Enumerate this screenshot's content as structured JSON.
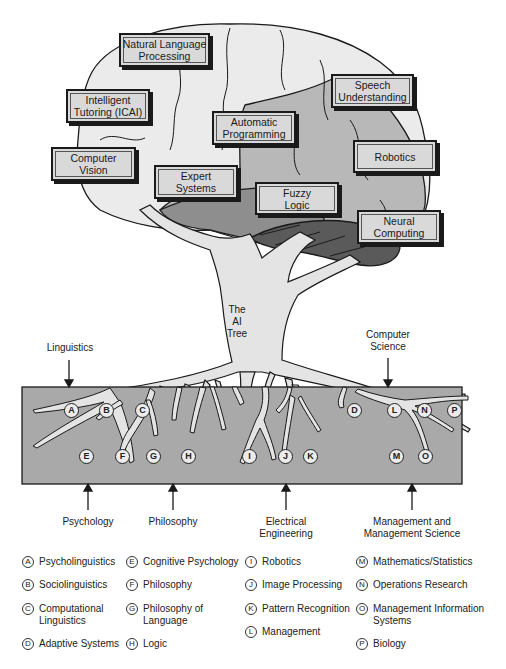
{
  "title": "The AI Tree",
  "trunk_label": "The\nAI\nTree",
  "brain_boxes": [
    {
      "id": "nlp",
      "label": "Natural Language\nProcessing"
    },
    {
      "id": "icai",
      "label": "Intelligent\nTutoring (ICAI)"
    },
    {
      "id": "vision",
      "label": "Computer\nVision"
    },
    {
      "id": "autoprog",
      "label": "Automatic\nProgramming"
    },
    {
      "id": "expert",
      "label": "Expert\nSystems"
    },
    {
      "id": "fuzzy",
      "label": "Fuzzy\nLogic"
    },
    {
      "id": "speech",
      "label": "Speech\nUnderstanding"
    },
    {
      "id": "robotics",
      "label": "Robotics"
    },
    {
      "id": "neural",
      "label": "Neural\nComputing"
    }
  ],
  "disciplines_top": [
    {
      "label": "Linguistics"
    },
    {
      "label": "Computer\nScience"
    }
  ],
  "disciplines_bottom": [
    {
      "label": "Psychology"
    },
    {
      "label": "Philosophy"
    },
    {
      "label": "Electrical\nEngineering"
    },
    {
      "label": "Management and\nManagement Science"
    }
  ],
  "root_letters": [
    "A",
    "B",
    "C",
    "D",
    "E",
    "F",
    "G",
    "H",
    "I",
    "J",
    "K",
    "L",
    "M",
    "N",
    "O",
    "P"
  ],
  "legend": [
    {
      "letter": "A",
      "label": "Psycholinguistics"
    },
    {
      "letter": "B",
      "label": "Sociolinguistics"
    },
    {
      "letter": "C",
      "label": "Computational\nLinguistics"
    },
    {
      "letter": "D",
      "label": "Adaptive Systems"
    },
    {
      "letter": "E",
      "label": "Cognitive Psychology"
    },
    {
      "letter": "F",
      "label": "Philosophy"
    },
    {
      "letter": "G",
      "label": "Philosophy of\nLanguage"
    },
    {
      "letter": "H",
      "label": "Logic"
    },
    {
      "letter": "I",
      "label": "Robotics"
    },
    {
      "letter": "J",
      "label": "Image Processing"
    },
    {
      "letter": "K",
      "label": "Pattern Recognition"
    },
    {
      "letter": "L",
      "label": "Management"
    },
    {
      "letter": "M",
      "label": "Mathematics/Statistics"
    },
    {
      "letter": "N",
      "label": "Operations Research"
    },
    {
      "letter": "O",
      "label": "Management Information\nSystems"
    },
    {
      "letter": "P",
      "label": "Biology"
    }
  ],
  "colors": {
    "brain_light": "#ebebeb",
    "brain_mid": "#b8b8b8",
    "brain_dark": "#8e8e8e",
    "cerebellum": "#5a5a5a",
    "tree": "#e4e4e4",
    "soil": "#a9a9a9",
    "box_fill": "#d9d9d9",
    "outline": "#1a1a1a"
  }
}
